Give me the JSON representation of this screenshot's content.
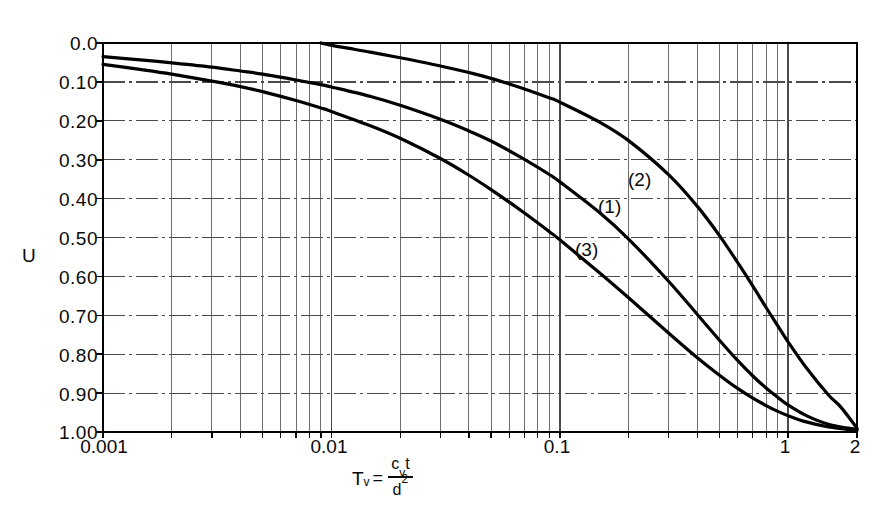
{
  "chart": {
    "type": "line",
    "title": "",
    "ylabel": "U",
    "xlabel_parts": {
      "symbol": "T",
      "symbol_sub": "v",
      "equals": "=",
      "numerator": "c",
      "numerator_sub": "v",
      "numerator_t": "t",
      "denominator": "d",
      "denominator_sup": "2"
    },
    "xlabel_plain": "Tv = cv t / d^2",
    "x_scale": "log",
    "xlim": [
      0.001,
      2
    ],
    "ylim": [
      0.0,
      1.0
    ],
    "y_inverted": true,
    "grid": "major-and-minor-log",
    "x_tick_labels": [
      "0.001",
      "0.01",
      "0.1",
      "1",
      "2"
    ],
    "x_tick_values": [
      0.001,
      0.01,
      0.1,
      1,
      2
    ],
    "y_tick_labels": [
      "0.0",
      "0.10",
      "0.20",
      "0.30",
      "0.40",
      "0.50",
      "0.60",
      "0.70",
      "0.80",
      "0.90",
      "1.00"
    ],
    "y_tick_values": [
      0.0,
      0.1,
      0.2,
      0.3,
      0.4,
      0.5,
      0.6,
      0.7,
      0.8,
      0.9,
      1.0
    ],
    "legend_position": "inline-annotations",
    "annotations": [
      {
        "text": "(1)",
        "x": 0.155,
        "y": 0.425
      },
      {
        "text": "(2)",
        "x": 0.235,
        "y": 0.355
      },
      {
        "text": "(3)",
        "x": 0.122,
        "y": 0.535
      }
    ],
    "series": [
      {
        "name": "(1)",
        "points": [
          [
            0.001,
            0.035
          ],
          [
            0.0015,
            0.044
          ],
          [
            0.002,
            0.051
          ],
          [
            0.003,
            0.062
          ],
          [
            0.004,
            0.072
          ],
          [
            0.005,
            0.08
          ],
          [
            0.007,
            0.095
          ],
          [
            0.009,
            0.107
          ],
          [
            0.01,
            0.113
          ],
          [
            0.015,
            0.138
          ],
          [
            0.02,
            0.16
          ],
          [
            0.03,
            0.196
          ],
          [
            0.04,
            0.226
          ],
          [
            0.05,
            0.252
          ],
          [
            0.07,
            0.299
          ],
          [
            0.09,
            0.338
          ],
          [
            0.1,
            0.357
          ],
          [
            0.15,
            0.437
          ],
          [
            0.2,
            0.504
          ],
          [
            0.3,
            0.613
          ],
          [
            0.4,
            0.698
          ],
          [
            0.5,
            0.764
          ],
          [
            0.6,
            0.816
          ],
          [
            0.7,
            0.856
          ],
          [
            0.8,
            0.887
          ],
          [
            0.9,
            0.911
          ],
          [
            1.0,
            0.931
          ],
          [
            1.2,
            0.958
          ],
          [
            1.5,
            0.98
          ],
          [
            2.0,
            0.994
          ]
        ]
      },
      {
        "name": "(2)",
        "points": [
          [
            0.009,
            0.0
          ],
          [
            0.01,
            0.006
          ],
          [
            0.012,
            0.014
          ],
          [
            0.015,
            0.024
          ],
          [
            0.02,
            0.038
          ],
          [
            0.03,
            0.059
          ],
          [
            0.04,
            0.076
          ],
          [
            0.05,
            0.091
          ],
          [
            0.07,
            0.118
          ],
          [
            0.09,
            0.141
          ],
          [
            0.1,
            0.152
          ],
          [
            0.15,
            0.204
          ],
          [
            0.2,
            0.251
          ],
          [
            0.3,
            0.339
          ],
          [
            0.4,
            0.42
          ],
          [
            0.5,
            0.495
          ],
          [
            0.6,
            0.564
          ],
          [
            0.7,
            0.625
          ],
          [
            0.8,
            0.68
          ],
          [
            0.9,
            0.727
          ],
          [
            1.0,
            0.769
          ],
          [
            1.2,
            0.835
          ],
          [
            1.5,
            0.905
          ],
          [
            1.7,
            0.936
          ],
          [
            2.0,
            0.99
          ]
        ]
      },
      {
        "name": "(3)",
        "points": [
          [
            0.001,
            0.055
          ],
          [
            0.0015,
            0.069
          ],
          [
            0.002,
            0.08
          ],
          [
            0.003,
            0.098
          ],
          [
            0.004,
            0.112
          ],
          [
            0.005,
            0.125
          ],
          [
            0.007,
            0.148
          ],
          [
            0.009,
            0.167
          ],
          [
            0.01,
            0.176
          ],
          [
            0.015,
            0.214
          ],
          [
            0.02,
            0.245
          ],
          [
            0.03,
            0.297
          ],
          [
            0.04,
            0.34
          ],
          [
            0.05,
            0.377
          ],
          [
            0.07,
            0.437
          ],
          [
            0.09,
            0.485
          ],
          [
            0.1,
            0.506
          ],
          [
            0.15,
            0.592
          ],
          [
            0.2,
            0.655
          ],
          [
            0.3,
            0.746
          ],
          [
            0.4,
            0.809
          ],
          [
            0.5,
            0.854
          ],
          [
            0.6,
            0.888
          ],
          [
            0.7,
            0.913
          ],
          [
            0.8,
            0.932
          ],
          [
            0.9,
            0.947
          ],
          [
            1.0,
            0.958
          ],
          [
            1.2,
            0.974
          ],
          [
            1.5,
            0.987
          ],
          [
            2.0,
            0.996
          ]
        ]
      }
    ],
    "colors": {
      "curve": "#000000",
      "grid_major": "#4a4a4a",
      "grid_minor": "#6e6e6e",
      "axis": "#000000",
      "background": "#ffffff"
    }
  }
}
